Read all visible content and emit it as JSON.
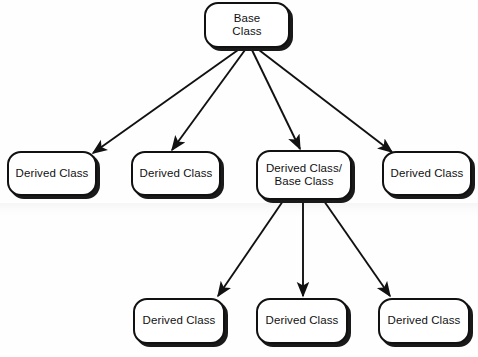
{
  "diagram": {
    "type": "tree",
    "background_color": "#fefefe",
    "stroke_color": "#111111",
    "node_fill": "#ffffff",
    "shadow_color": "#1a1a1a",
    "nodes": [
      {
        "id": "root",
        "label": "Base\nClass",
        "x": 204,
        "y": 2,
        "w": 86,
        "h": 46
      },
      {
        "id": "d1",
        "label": "Derived Class",
        "x": 7,
        "y": 151,
        "w": 90,
        "h": 45
      },
      {
        "id": "d2",
        "label": "Derived Class",
        "x": 131,
        "y": 151,
        "w": 90,
        "h": 45
      },
      {
        "id": "mid",
        "label": "Derived Class/\nBase Class",
        "x": 256,
        "y": 150,
        "w": 96,
        "h": 50
      },
      {
        "id": "d4",
        "label": "Derived Class",
        "x": 382,
        "y": 151,
        "w": 90,
        "h": 45
      },
      {
        "id": "d5",
        "label": "Derived Class",
        "x": 133,
        "y": 298,
        "w": 92,
        "h": 46
      },
      {
        "id": "d6",
        "label": "Derived Class",
        "x": 256,
        "y": 298,
        "w": 92,
        "h": 46
      },
      {
        "id": "d7",
        "label": "Derived Class",
        "x": 378,
        "y": 298,
        "w": 92,
        "h": 46
      }
    ],
    "edges": [
      {
        "from": "root",
        "to": "d1",
        "x1": 238,
        "y1": 50,
        "x2": 93,
        "y2": 153
      },
      {
        "from": "root",
        "to": "d2",
        "x1": 245,
        "y1": 50,
        "x2": 172,
        "y2": 150
      },
      {
        "from": "root",
        "to": "mid",
        "x1": 252,
        "y1": 50,
        "x2": 300,
        "y2": 149
      },
      {
        "from": "root",
        "to": "d4",
        "x1": 259,
        "y1": 50,
        "x2": 392,
        "y2": 152
      },
      {
        "from": "mid",
        "to": "d5",
        "x1": 283,
        "y1": 201,
        "x2": 218,
        "y2": 296
      },
      {
        "from": "mid",
        "to": "d6",
        "x1": 303,
        "y1": 201,
        "x2": 303,
        "y2": 296
      },
      {
        "from": "mid",
        "to": "d7",
        "x1": 324,
        "y1": 201,
        "x2": 390,
        "y2": 296
      }
    ]
  }
}
